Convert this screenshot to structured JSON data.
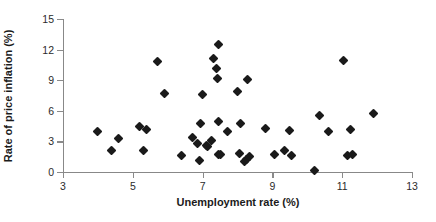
{
  "chart_data": {
    "type": "scatter",
    "title": "",
    "xlabel": "Unemployment rate (%)",
    "ylabel": "Rate of price inflation (%)",
    "xlim": [
      3,
      13
    ],
    "ylim": [
      0,
      15
    ],
    "xticks": [
      3,
      5,
      7,
      9,
      11,
      13
    ],
    "yticks": [
      0,
      3,
      6,
      9,
      12,
      15
    ],
    "grid": false,
    "legend": null,
    "marker": "diamond",
    "marker_color": "#1a1a1a",
    "series": [
      {
        "name": "observations",
        "points": [
          [
            4.0,
            4.0
          ],
          [
            4.4,
            2.1
          ],
          [
            4.6,
            3.3
          ],
          [
            5.2,
            4.5
          ],
          [
            5.3,
            2.1
          ],
          [
            5.4,
            4.2
          ],
          [
            5.7,
            10.8
          ],
          [
            5.9,
            7.7
          ],
          [
            6.4,
            1.6
          ],
          [
            6.7,
            3.4
          ],
          [
            6.85,
            2.75
          ],
          [
            6.9,
            1.1
          ],
          [
            6.95,
            4.8
          ],
          [
            7.0,
            7.6
          ],
          [
            7.1,
            2.6
          ],
          [
            7.15,
            2.5
          ],
          [
            7.25,
            3.1
          ],
          [
            7.3,
            11.1
          ],
          [
            7.4,
            10.15
          ],
          [
            7.42,
            9.15
          ],
          [
            7.45,
            12.5
          ],
          [
            7.45,
            5.0
          ],
          [
            7.45,
            1.75
          ],
          [
            7.5,
            1.7
          ],
          [
            7.7,
            3.95
          ],
          [
            8.0,
            7.9
          ],
          [
            8.05,
            1.8
          ],
          [
            8.1,
            4.8
          ],
          [
            8.2,
            1.05
          ],
          [
            8.25,
            1.2
          ],
          [
            8.3,
            9.05
          ],
          [
            8.35,
            1.5
          ],
          [
            8.8,
            4.3
          ],
          [
            9.05,
            1.75
          ],
          [
            9.35,
            2.15
          ],
          [
            9.5,
            4.05
          ],
          [
            9.55,
            1.65
          ],
          [
            10.2,
            0.1
          ],
          [
            10.35,
            5.5
          ],
          [
            10.6,
            3.95
          ],
          [
            11.05,
            10.9
          ],
          [
            11.15,
            1.6
          ],
          [
            11.25,
            4.2
          ],
          [
            11.3,
            1.75
          ],
          [
            11.9,
            5.75
          ]
        ]
      }
    ]
  }
}
